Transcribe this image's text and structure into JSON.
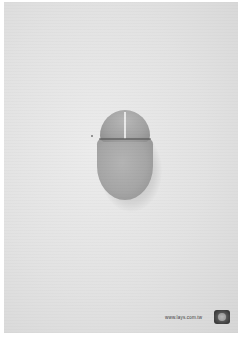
{
  "ad": {
    "subject": "potato chip shaped as computer mouse",
    "footer": {
      "url": "www.lays.com.tw",
      "logo_icon": "lays-logo-icon"
    }
  },
  "colors": {
    "background": "#e2e2e2",
    "chip": "#a6a6a6",
    "text": "#3a3a3a"
  }
}
